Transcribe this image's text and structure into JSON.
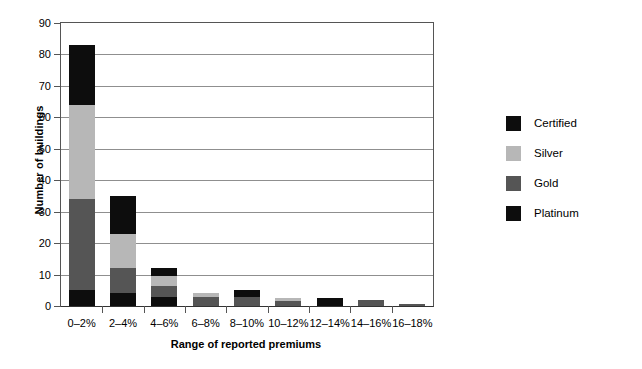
{
  "chart_data": {
    "type": "bar",
    "subtype": "stacked-bar",
    "title": "",
    "xlabel": "Range of reported premiums",
    "ylabel": "Number of buildings",
    "categories": [
      "0–2%",
      "2–4%",
      "4–6%",
      "6–8%",
      "8–10%",
      "10–12%",
      "12–14%",
      "14–16%",
      "16–18%"
    ],
    "series": [
      {
        "name": "Platinum",
        "color": "#0d0d0d",
        "values": [
          5,
          4,
          3,
          0,
          0,
          0,
          0,
          0,
          0
        ]
      },
      {
        "name": "Gold",
        "color": "#555555",
        "values": [
          29,
          8,
          3.5,
          3,
          3,
          1.5,
          0,
          1.8,
          0.8
        ]
      },
      {
        "name": "Silver",
        "color": "#b7b7b7",
        "values": [
          30,
          11,
          3,
          1,
          0,
          1,
          0,
          0,
          0
        ]
      },
      {
        "name": "Certified",
        "color": "#0d0d0d",
        "values": [
          19,
          12,
          2.5,
          0,
          2,
          0,
          2.5,
          0,
          0
        ]
      }
    ],
    "totals": [
      83,
      35,
      12,
      4,
      5,
      2.5,
      2.5,
      1.8,
      0.8
    ],
    "ylim": [
      0,
      90
    ],
    "yticks": [
      0,
      10,
      20,
      30,
      40,
      50,
      60,
      70,
      80,
      90
    ],
    "ytick_labels": [
      "0",
      "10",
      "20",
      "30",
      "40",
      "50",
      "60",
      "70",
      "80",
      "90"
    ],
    "grid": true,
    "grid_axis": "y",
    "legend_position": "right",
    "legend": [
      {
        "label": "Certified",
        "color": "#0d0d0d"
      },
      {
        "label": "Silver",
        "color": "#b7b7b7"
      },
      {
        "label": "Gold",
        "color": "#555555"
      },
      {
        "label": "Platinum",
        "color": "#0d0d0d"
      }
    ]
  }
}
